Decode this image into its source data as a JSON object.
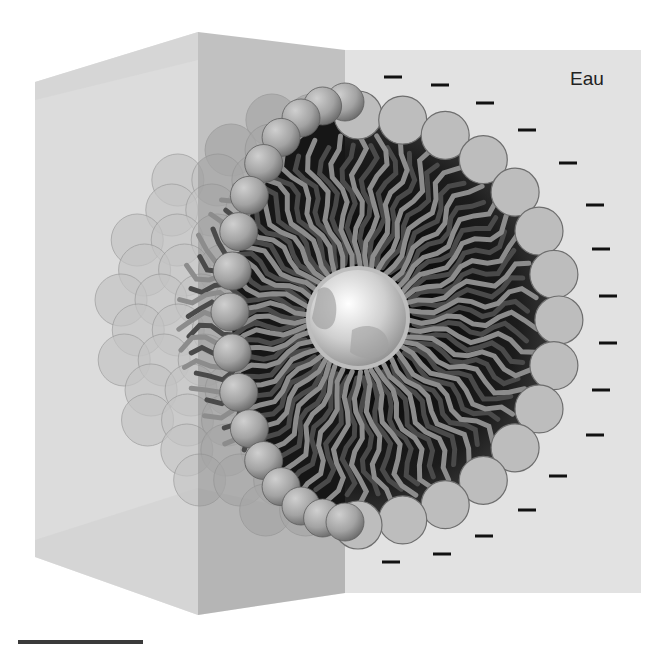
{
  "labels": {
    "water": "Eau"
  },
  "colors": {
    "background": "#ffffff",
    "water_panel": "#e2e2e2",
    "left_face": "#d9d9d9",
    "top_face": "#cfcfcf",
    "middle_panel": "#a8a8a8",
    "interior": "#141414",
    "tail": "#8c8c8c",
    "tail_back": "#4a4a4a",
    "head_fill": "#bdbdbd",
    "head_stroke": "#6e6e6e",
    "core": "#d8d8d8",
    "charge": "#111111"
  },
  "micelle": {
    "center": [
      358,
      320
    ],
    "head_radius_px": 24,
    "head_ring_radius_px": 205,
    "core_radius_px": 50,
    "heads_visible": 17,
    "tails_count": 44
  },
  "charges": {
    "symbol": "−",
    "count": 20,
    "positions": [
      [
        393,
        77
      ],
      [
        440,
        85
      ],
      [
        485,
        103
      ],
      [
        527,
        130
      ],
      [
        568,
        163
      ],
      [
        595,
        205
      ],
      [
        601,
        249
      ],
      [
        608,
        296
      ],
      [
        608,
        343
      ],
      [
        601,
        390
      ],
      [
        595,
        435
      ],
      [
        558,
        476
      ],
      [
        527,
        510
      ],
      [
        484,
        536
      ],
      [
        442,
        554
      ],
      [
        391,
        562
      ]
    ]
  },
  "scale_bar": {
    "length_px": 125
  }
}
